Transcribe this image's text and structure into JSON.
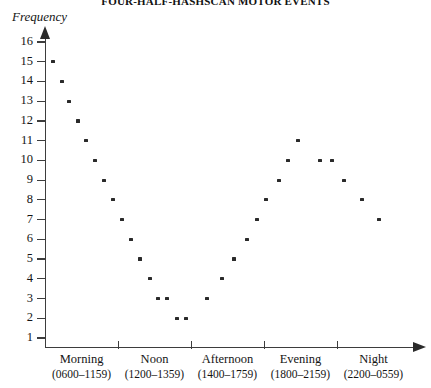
{
  "chart_data": {
    "type": "scatter",
    "title": "FOUR-HALF-HASHSCAN MOTOR EVENTS",
    "xlabel": "",
    "ylabel": "Frequency",
    "ylim": [
      1,
      16
    ],
    "yticks": [
      16,
      15,
      14,
      13,
      12,
      11,
      10,
      9,
      8,
      7,
      6,
      5,
      4,
      3,
      2,
      1
    ],
    "grid": false,
    "legend": "none",
    "marker": "dot",
    "marker_color": "#2a2a2a",
    "categories": [
      {
        "name": "Morning",
        "range": "(0600–1159)"
      },
      {
        "name": "Noon",
        "range": "(1200–1359)"
      },
      {
        "name": "Afternoon",
        "range": "(1400–1759)"
      },
      {
        "name": "Evening",
        "range": "(1800–2159)"
      },
      {
        "name": "Night",
        "range": "(2200–0559)"
      }
    ],
    "points": [
      {
        "x": 53,
        "y": 15
      },
      {
        "x": 62,
        "y": 14
      },
      {
        "x": 69,
        "y": 13
      },
      {
        "x": 78,
        "y": 12
      },
      {
        "x": 86,
        "y": 11
      },
      {
        "x": 95,
        "y": 10
      },
      {
        "x": 104,
        "y": 9
      },
      {
        "x": 113,
        "y": 8
      },
      {
        "x": 122,
        "y": 7
      },
      {
        "x": 131,
        "y": 6
      },
      {
        "x": 140,
        "y": 5
      },
      {
        "x": 150,
        "y": 4
      },
      {
        "x": 158,
        "y": 3
      },
      {
        "x": 167,
        "y": 3
      },
      {
        "x": 177,
        "y": 2
      },
      {
        "x": 186,
        "y": 2
      },
      {
        "x": 207,
        "y": 3
      },
      {
        "x": 222,
        "y": 4
      },
      {
        "x": 234,
        "y": 5
      },
      {
        "x": 247,
        "y": 6
      },
      {
        "x": 257,
        "y": 7
      },
      {
        "x": 266,
        "y": 8
      },
      {
        "x": 279,
        "y": 9
      },
      {
        "x": 288,
        "y": 10
      },
      {
        "x": 298,
        "y": 11
      },
      {
        "x": 320,
        "y": 10
      },
      {
        "x": 332,
        "y": 10
      },
      {
        "x": 344,
        "y": 9
      },
      {
        "x": 362,
        "y": 8
      },
      {
        "x": 379,
        "y": 7
      }
    ]
  },
  "axis": {
    "y_arrow": "up-arrow-icon",
    "x_arrow": "right-arrow-icon"
  }
}
